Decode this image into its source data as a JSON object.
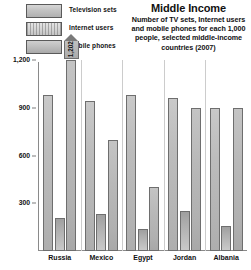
{
  "legend": {
    "items": [
      {
        "label": "Television sets",
        "swatch": "tv-swatch-icon"
      },
      {
        "label": "Internet users",
        "swatch": "internet-swatch-icon"
      },
      {
        "label": "Mobile phones",
        "swatch": "mobile-swatch-icon"
      }
    ]
  },
  "title": "Middle Income",
  "subtitle": "Number of TV sets, Internet users and mobile phones for each 1,000 people, selected middle-income countries (2007)",
  "callout": {
    "value": "1,202",
    "applies_to": {
      "category": "Russia",
      "series": "Mobile phones"
    }
  },
  "chart_data": {
    "type": "bar",
    "title": "Middle Income",
    "subtitle": "Number of TV sets, Internet users and mobile phones for each 1,000 people, selected middle-income countries (2007)",
    "xlabel": "",
    "ylabel": "",
    "ylim": [
      0,
      1200
    ],
    "yticks": [
      300,
      600,
      900,
      1200
    ],
    "ytick_labels": [
      "300",
      "600",
      "900",
      "1,200"
    ],
    "grid": false,
    "legend_position": "top-left",
    "categories": [
      "Russia",
      "Mexico",
      "Egypt",
      "Jordan",
      "Albania"
    ],
    "series": [
      {
        "name": "Television sets",
        "values": [
          980,
          940,
          980,
          960,
          900
        ]
      },
      {
        "name": "Internet users",
        "values": [
          210,
          230,
          140,
          250,
          160
        ]
      },
      {
        "name": "Mobile phones",
        "values": [
          1202,
          700,
          400,
          900,
          900
        ]
      }
    ],
    "annotations": [
      {
        "text": "1,202",
        "category": "Russia",
        "series": "Mobile phones",
        "note": "value exceeds axis maximum; shown in pointer callout above plot"
      }
    ]
  }
}
